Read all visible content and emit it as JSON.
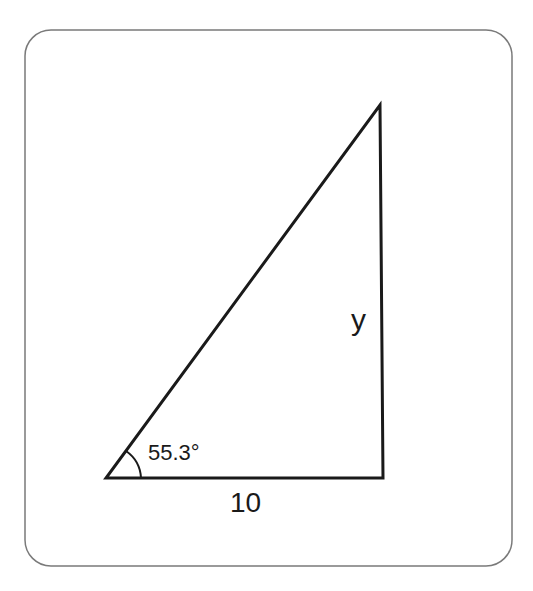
{
  "diagram": {
    "type": "right-triangle",
    "angle_label": "55.3°",
    "base_label": "10",
    "side_label": "y",
    "colors": {
      "stroke": "#1a1a1a",
      "frame": "#777777",
      "background": "#ffffff"
    }
  }
}
